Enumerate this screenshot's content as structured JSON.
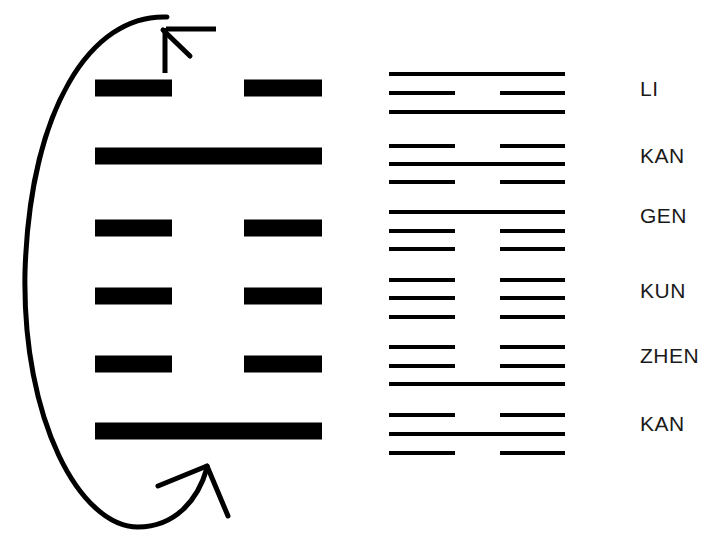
{
  "diagram": {
    "background_color": "#ffffff",
    "ink_color": "#000000",
    "text_color": "#1a1a1a"
  },
  "main_hexagram": {
    "name": "main-hexagram",
    "x_left": 95,
    "x_right": 322,
    "gap_left_end": 172,
    "gap_right_start": 244,
    "bar_thickness": 17,
    "lines": [
      {
        "position": 6,
        "type": "broken",
        "y": 88
      },
      {
        "position": 5,
        "type": "solid",
        "y": 156
      },
      {
        "position": 4,
        "type": "broken",
        "y": 228
      },
      {
        "position": 3,
        "type": "broken",
        "y": 296
      },
      {
        "position": 2,
        "type": "broken",
        "y": 364
      },
      {
        "position": 1,
        "type": "solid",
        "y": 431
      }
    ]
  },
  "cycle_arrow": {
    "name": "cyclic-ellipse-arrow",
    "shape": "ellipse-with-two-arrowheads",
    "cx": 122,
    "cy": 272,
    "rx": 97,
    "ry": 255,
    "stroke_width": 5,
    "arrow_top_label": "up-right arrowhead",
    "arrow_bottom_label": "up-right arrowhead"
  },
  "trigram_column": {
    "name": "trigram-column",
    "x_left": 389,
    "x_right": 565,
    "gap_left_end": 455,
    "gap_right_start": 500,
    "line_thickness": 4,
    "label_x": 640,
    "groups": [
      {
        "label": "LI",
        "label_y": 88,
        "lines": [
          {
            "type": "solid",
            "y": 74
          },
          {
            "type": "broken",
            "y": 93
          },
          {
            "type": "solid",
            "y": 112
          }
        ]
      },
      {
        "label": "KAN",
        "label_y": 155,
        "lines": [
          {
            "type": "broken",
            "y": 146
          },
          {
            "type": "solid",
            "y": 164
          },
          {
            "type": "broken",
            "y": 182
          }
        ]
      },
      {
        "label": "GEN",
        "label_y": 215,
        "lines": [
          {
            "type": "solid",
            "y": 212
          },
          {
            "type": "broken",
            "y": 231
          },
          {
            "type": "broken",
            "y": 249
          }
        ]
      },
      {
        "label": "KUN",
        "label_y": 290,
        "lines": [
          {
            "type": "broken",
            "y": 280
          },
          {
            "type": "broken",
            "y": 298
          },
          {
            "type": "broken",
            "y": 317
          }
        ]
      },
      {
        "label": "ZHEN",
        "label_y": 355,
        "lines": [
          {
            "type": "broken",
            "y": 347
          },
          {
            "type": "broken",
            "y": 366
          },
          {
            "type": "solid",
            "y": 384
          }
        ]
      },
      {
        "label": "KAN",
        "label_y": 423,
        "lines": [
          {
            "type": "broken",
            "y": 415
          },
          {
            "type": "solid",
            "y": 434
          },
          {
            "type": "broken",
            "y": 453
          }
        ]
      }
    ]
  }
}
